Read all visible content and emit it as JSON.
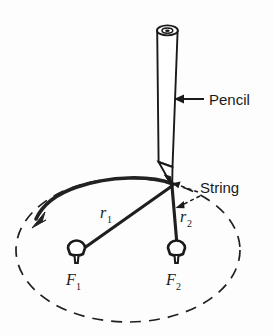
{
  "figure": {
    "domain_type": "diagram",
    "background_color": "#fdfdfd",
    "ink_color": "#1a1a1a",
    "canvas": {
      "width": 273,
      "height": 336
    }
  },
  "labels": {
    "pencil": "Pencil",
    "string": "String",
    "r1": "r",
    "r1_sub": "1",
    "r2": "r",
    "r2_sub": "2",
    "f1": "F",
    "f1_sub": "1",
    "f2": "F",
    "f2_sub": "2"
  },
  "parts": {
    "pencil": {
      "name": "Pencil",
      "body_top_y": 28,
      "body_bottom_y": 165,
      "tip_y": 185,
      "left_x": 156,
      "right_x": 179,
      "ferrule_dot": true
    },
    "tack_1": {
      "label": "F1",
      "x": 76,
      "y": 249
    },
    "tack_2": {
      "label": "F2",
      "x": 176,
      "y": 249
    },
    "pencil_tip_junction": {
      "x": 172,
      "y": 185
    },
    "string_segment_1": {
      "label": "r1",
      "from": "pencil_tip_junction",
      "to": "tack_1"
    },
    "string_segment_2": {
      "label": "r2",
      "from": "pencil_tip_junction",
      "to": "tack_2"
    },
    "ellipse": {
      "center_x": 128,
      "center_y": 250,
      "radius_x": 112,
      "radius_y": 72,
      "style": "dashed"
    },
    "traced_arc": {
      "description": "Thick solid arc traced by pencil, arrowhead pointing counter-clockwise to the left",
      "arrow_direction": "counter-clockwise"
    }
  },
  "annotations": [
    {
      "name": "pencil-leader",
      "label": "Pencil",
      "style": "solid-arrow-left",
      "text_x": 211,
      "text_y": 104
    },
    {
      "name": "string-leader",
      "label": "String",
      "style": "dashed-double-arrow",
      "text_x": 201,
      "text_y": 193
    }
  ]
}
